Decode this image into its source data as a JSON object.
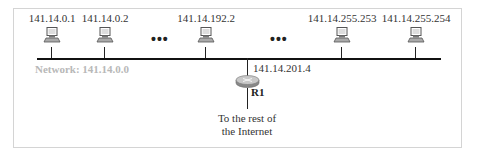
{
  "diagram": {
    "network": {
      "label": "Network: 141.14.0.0",
      "label_color": "#b8b8b8"
    },
    "hosts": [
      {
        "ip": "141.14.0.1"
      },
      {
        "ip": "141.14.0.2"
      },
      {
        "ip": "141.14.192.2"
      },
      {
        "ip": "141.14.255.253"
      },
      {
        "ip": "141.14.255.254"
      }
    ],
    "ellipsis": [
      "•••",
      "•••"
    ],
    "router": {
      "name": "R1",
      "ip": "141.14.201.4"
    },
    "uplink": {
      "line1": "To the rest of",
      "line2": "the Internet"
    }
  }
}
